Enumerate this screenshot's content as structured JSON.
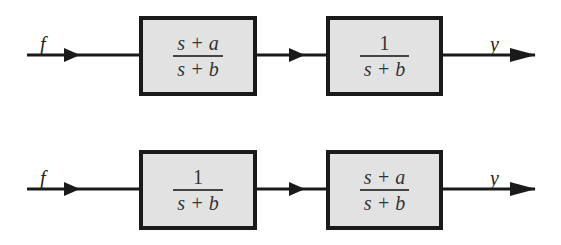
{
  "diagram": {
    "type": "block-diagram",
    "rows": [
      {
        "input_label": "f",
        "output_label": "y",
        "blocks": [
          {
            "numerator": "s + a",
            "denominator": "s + b"
          },
          {
            "numerator": "1",
            "denominator": "s + b"
          }
        ]
      },
      {
        "input_label": "f",
        "output_label": "y",
        "blocks": [
          {
            "numerator": "1",
            "denominator": "s + b"
          },
          {
            "numerator": "s + a",
            "denominator": "s + b"
          }
        ]
      }
    ],
    "colors": {
      "block_fill": "#e2e2e2",
      "line": "#1a1a1a"
    }
  }
}
